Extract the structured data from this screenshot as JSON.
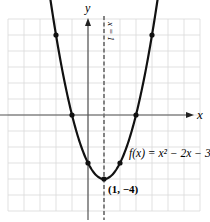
{
  "chart_data": {
    "type": "line",
    "title": "",
    "xlabel": "x",
    "ylabel": "y",
    "function": "f(x) = x^2 - 2x - 3",
    "label_text": "f(x) = x² − 2x − 3",
    "axis_of_symmetry": {
      "x": 1,
      "label": "x = 1",
      "style": "dashed"
    },
    "vertex": {
      "x": 1,
      "y": -4,
      "label": "(1, −4)"
    },
    "points": [
      {
        "x": -2,
        "y": 5
      },
      {
        "x": -1,
        "y": 0
      },
      {
        "x": 0,
        "y": -3
      },
      {
        "x": 1,
        "y": -4
      },
      {
        "x": 2,
        "y": -3
      },
      {
        "x": 3,
        "y": 0
      },
      {
        "x": 4,
        "y": 5
      }
    ],
    "xlim": [
      -5.5,
      7
    ],
    "ylim": [
      -6,
      6
    ],
    "grid": true,
    "grid_step": 1
  },
  "labels": {
    "x_axis": "x",
    "y_axis": "y",
    "symmetry": "x = 1",
    "function": "f(x) = x² − 2x − 3",
    "vertex": "(1, −4)"
  }
}
